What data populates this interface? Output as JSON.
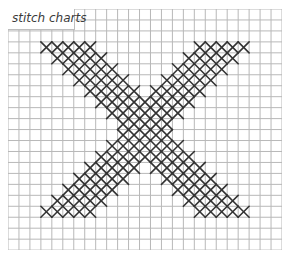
{
  "title": "stitch charts",
  "grid": {
    "columns": 25,
    "rows": 22,
    "cell_size": 10.96,
    "line_color": "#b8b8b8",
    "border_color": "#a8a8a8"
  },
  "stitch": {
    "color": "#333333",
    "shape": "cross",
    "band_width": 5,
    "rows": [
      {
        "row": 3,
        "left_start": 3,
        "right_start": 17
      },
      {
        "row": 4,
        "left_start": 4,
        "right_start": 16
      },
      {
        "row": 5,
        "left_start": 5,
        "right_start": 15
      },
      {
        "row": 6,
        "left_start": 6,
        "right_start": 14
      },
      {
        "row": 7,
        "left_start": 7,
        "right_start": 13
      },
      {
        "row": 8,
        "left_start": 8,
        "right_start": 12
      },
      {
        "row": 9,
        "left_start": 9,
        "right_start": 11
      },
      {
        "row": 10,
        "left_start": 10,
        "right_start": 10
      },
      {
        "row": 11,
        "left_start": 10,
        "right_start": 10
      },
      {
        "row": 12,
        "left_start": 11,
        "right_start": 9
      },
      {
        "row": 13,
        "left_start": 12,
        "right_start": 8
      },
      {
        "row": 14,
        "left_start": 13,
        "right_start": 7
      },
      {
        "row": 15,
        "left_start": 14,
        "right_start": 6
      },
      {
        "row": 16,
        "left_start": 15,
        "right_start": 5
      },
      {
        "row": 17,
        "left_start": 16,
        "right_start": 4
      },
      {
        "row": 18,
        "left_start": 17,
        "right_start": 3
      }
    ]
  }
}
